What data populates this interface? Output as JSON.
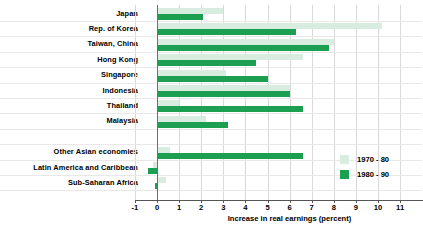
{
  "chart_data": {
    "type": "bar",
    "orientation": "horizontal",
    "title": "",
    "xlabel": "Increase in real earnings (percent)",
    "ylabel": "",
    "xlim": [
      -1,
      11
    ],
    "xticks": [
      -1,
      0,
      1,
      2,
      3,
      4,
      5,
      6,
      7,
      8,
      9,
      10,
      11
    ],
    "xticklabels": [
      "-1",
      "0",
      "1",
      "2",
      "3",
      "4",
      "5",
      "6",
      "7",
      "8",
      "9",
      "10",
      "11"
    ],
    "grid": true,
    "legend_position": "right-inside",
    "categories": [
      "Japan",
      "Rep. of Korea",
      "Taiwan, China",
      "Hong Kong",
      "Singapore",
      "Indonesia",
      "Thailand",
      "Malaysia",
      "",
      "Other Asian economies",
      "Latin America and Caribbean",
      "Sub-Saharan Africa"
    ],
    "series": [
      {
        "name": "1970 - 80",
        "color": "#d8ece0",
        "values": [
          3.0,
          10.2,
          8.0,
          6.6,
          3.1,
          6.0,
          1.0,
          2.2,
          null,
          0.6,
          -0.2,
          0.4
        ]
      },
      {
        "name": "1980 - 90",
        "color": "#1d9f51",
        "values": [
          2.1,
          6.3,
          7.8,
          4.5,
          5.0,
          6.0,
          6.6,
          3.2,
          null,
          6.6,
          -0.4,
          -0.1
        ]
      }
    ],
    "legend": [
      "1970 - 80",
      "1980 - 90"
    ]
  }
}
